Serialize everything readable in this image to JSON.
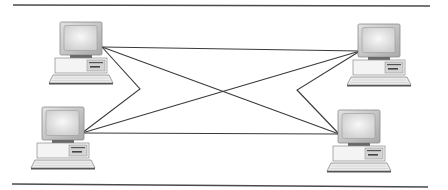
{
  "diagram": {
    "type": "network-topology",
    "colors": {
      "rule": "#4a4a4a",
      "link": "#3a3a3a",
      "monitor_bezel": "#c8c8c8",
      "screen": "#e6e6e6",
      "case": "#f2f2f2",
      "keyboard": "#e8e8e8",
      "dark_trim": "#555555"
    },
    "rules": [
      {
        "name": "top-rule",
        "x1": 13,
        "y1": 5,
        "x2": 430,
        "y2": 6
      },
      {
        "name": "bottom-rule",
        "x1": 12,
        "y1": 184,
        "x2": 428,
        "y2": 187
      }
    ],
    "nodes": [
      {
        "id": "computer-top-left",
        "x": 50,
        "y": 22,
        "port": [
          102,
          47
        ]
      },
      {
        "id": "computer-top-right",
        "x": 348,
        "y": 24,
        "port": [
          360,
          51
        ]
      },
      {
        "id": "computer-bottom-left",
        "x": 32,
        "y": 107,
        "port": [
          82,
          133
        ]
      },
      {
        "id": "computer-bottom-right",
        "x": 328,
        "y": 110,
        "port": [
          339,
          134
        ]
      }
    ],
    "links": [
      {
        "from": "computer-top-left",
        "to": "computer-top-right",
        "points": "102,47 360,51"
      },
      {
        "from": "computer-bottom-left",
        "to": "computer-bottom-right",
        "points": "82,133 339,134"
      },
      {
        "from": "computer-top-left",
        "to": "computer-bottom-right",
        "points": "102,47 339,134"
      },
      {
        "from": "computer-bottom-left",
        "to": "computer-top-right",
        "points": "82,133 360,51"
      },
      {
        "from": "computer-top-left",
        "to": "computer-bottom-left",
        "points": "102,47 140,89 82,133"
      },
      {
        "from": "computer-top-right",
        "to": "computer-bottom-right",
        "points": "360,51 297,90 339,134"
      }
    ]
  }
}
